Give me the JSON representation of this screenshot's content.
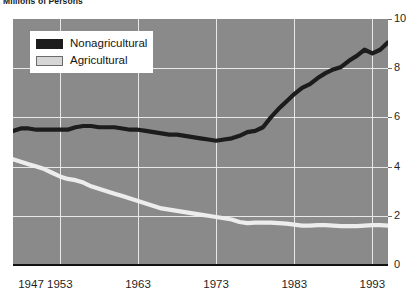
{
  "chart_data": {
    "type": "line",
    "title": "Millions of Persons",
    "xlabel": "",
    "ylabel": "",
    "xlim": [
      1947,
      1995
    ],
    "ylim": [
      0,
      10
    ],
    "grid": true,
    "legend_position": "upper-left-inside",
    "y_ticks": [
      10,
      8,
      6,
      4,
      2,
      0
    ],
    "x_ticks": [
      1947,
      1953,
      1963,
      1973,
      1983,
      1993
    ],
    "x_gridlines": [
      1953,
      1963,
      1973,
      1983,
      1993
    ],
    "colors": {
      "plot_background": "#8a8a8a",
      "gridline": "#e8e8e8",
      "nonagricultural": "#1c1c1c",
      "agricultural": "#ededed",
      "axis": "#111111",
      "page_background": "#ffffff"
    },
    "x": [
      1947,
      1948,
      1949,
      1950,
      1951,
      1952,
      1953,
      1954,
      1955,
      1956,
      1957,
      1958,
      1959,
      1960,
      1961,
      1962,
      1963,
      1964,
      1965,
      1966,
      1967,
      1968,
      1969,
      1970,
      1971,
      1972,
      1973,
      1974,
      1975,
      1976,
      1977,
      1978,
      1979,
      1980,
      1981,
      1982,
      1983,
      1984,
      1985,
      1986,
      1987,
      1988,
      1989,
      1990,
      1991,
      1992,
      1993,
      1994,
      1995
    ],
    "series": [
      {
        "name": "Nonagricultural",
        "color": "#1c1c1c",
        "values": [
          5.45,
          5.55,
          5.55,
          5.5,
          5.5,
          5.5,
          5.5,
          5.5,
          5.6,
          5.65,
          5.65,
          5.6,
          5.6,
          5.6,
          5.55,
          5.5,
          5.5,
          5.45,
          5.4,
          5.35,
          5.3,
          5.3,
          5.25,
          5.2,
          5.15,
          5.1,
          5.05,
          5.1,
          5.15,
          5.25,
          5.4,
          5.45,
          5.6,
          6.0,
          6.35,
          6.65,
          6.95,
          7.2,
          7.35,
          7.6,
          7.8,
          7.95,
          8.05,
          8.3,
          8.5,
          8.75,
          8.6,
          8.75,
          9.05
        ]
      },
      {
        "name": "Agricultural",
        "color": "#ededed",
        "values": [
          4.3,
          4.2,
          4.1,
          4.0,
          3.9,
          3.75,
          3.6,
          3.5,
          3.45,
          3.35,
          3.2,
          3.1,
          3.0,
          2.9,
          2.8,
          2.7,
          2.6,
          2.5,
          2.4,
          2.3,
          2.25,
          2.2,
          2.15,
          2.1,
          2.05,
          2.0,
          1.95,
          1.9,
          1.85,
          1.75,
          1.7,
          1.72,
          1.72,
          1.72,
          1.7,
          1.68,
          1.64,
          1.6,
          1.6,
          1.62,
          1.62,
          1.6,
          1.58,
          1.58,
          1.58,
          1.6,
          1.62,
          1.62,
          1.6
        ]
      }
    ]
  },
  "legend": {
    "items": [
      {
        "label": "Nonagricultural",
        "swatch": "dark"
      },
      {
        "label": "Agricultural",
        "swatch": "light"
      }
    ]
  }
}
